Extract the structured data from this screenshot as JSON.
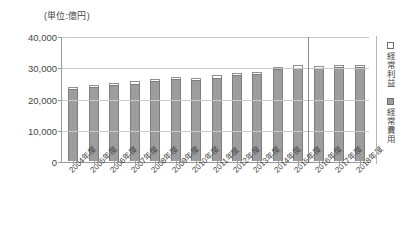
{
  "chart_data": {
    "type": "bar",
    "title": "",
    "subtitle": "",
    "unit_caption": "(単位:億円)",
    "xlabel": "",
    "ylabel": "",
    "ylim": [
      0,
      40000
    ],
    "ytick_values": [
      0,
      10000,
      20000,
      30000,
      40000
    ],
    "ytick_labels": [
      "0",
      "10,000",
      "20,000",
      "30,000",
      "40,000"
    ],
    "grid": true,
    "grid_axis": "y",
    "stacked": true,
    "legend_position": "right",
    "categories": [
      "2004年度",
      "2005年度",
      "2006年度",
      "2007年度",
      "2008年度",
      "2009年度",
      "2010年度",
      "2011年度",
      "2012年度",
      "2013年度",
      "2014年度",
      "2015年度",
      "2016年度",
      "2017年度",
      "2018年度"
    ],
    "series": [
      {
        "name": "経常費用",
        "color": "#9d9d9d",
        "values": [
          23100,
          23700,
          24200,
          24800,
          25500,
          26100,
          25900,
          26700,
          27600,
          27800,
          29300,
          29900,
          29900,
          30000,
          30100
        ]
      },
      {
        "name": "経常利益",
        "color": "#ffffff",
        "values": [
          600,
          500,
          700,
          800,
          800,
          700,
          700,
          800,
          700,
          800,
          700,
          700,
          600,
          700,
          600
        ]
      }
    ],
    "totals": [
      23700,
      24200,
      24900,
      25600,
      26300,
      26800,
      26600,
      27500,
      28300,
      28600,
      30000,
      30600,
      30500,
      30700,
      30700
    ],
    "annotations": [
      {
        "type": "vertical-divider",
        "after_category": "2015年度",
        "note": "separates actual results from projected years"
      }
    ]
  },
  "legend": {
    "items": [
      {
        "label": "経常利益",
        "swatch": "profit"
      },
      {
        "label": "経常費用",
        "swatch": "cost"
      }
    ]
  }
}
